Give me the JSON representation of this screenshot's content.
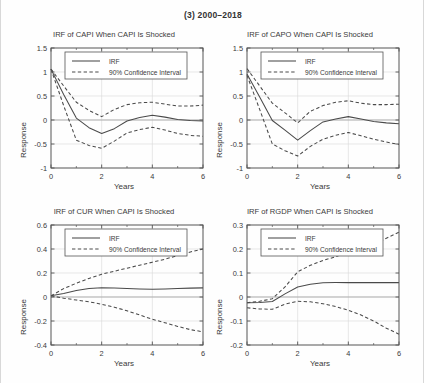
{
  "figure": {
    "title": "(3) 2000–2018",
    "background": "#ffffff",
    "line_color": "#4a4a4a",
    "axis_color": "#555555",
    "grid_color": "#d9d9d9"
  },
  "legend": {
    "irf_label": "IRF",
    "ci_label": "90% Confidence Interval"
  },
  "axis_titles": {
    "y": "Response",
    "x": "Years"
  },
  "chart_data": [
    {
      "type": "line",
      "id": "capi",
      "title": "IRF of CAPI When CAPI Is Shocked",
      "xlabel": "Years",
      "ylabel": "Response",
      "xlim": [
        0,
        6
      ],
      "ylim": [
        -1,
        1.5
      ],
      "xticks": [
        0,
        2,
        4,
        6
      ],
      "xticklabels": [
        "0",
        "2",
        "4",
        "6"
      ],
      "yticks": [
        -1,
        -0.5,
        0,
        0.5,
        1,
        1.5
      ],
      "yticklabels": [
        "-1",
        "-0.5",
        "0",
        "0.5",
        "1",
        "1.5"
      ],
      "grid": true,
      "legend_position": "top-center",
      "x": [
        0,
        0.5,
        1,
        1.5,
        2,
        2.5,
        3,
        3.5,
        4,
        4.5,
        5,
        5.5,
        6
      ],
      "series": [
        {
          "name": "IRF",
          "style": "solid",
          "values": [
            1.06,
            0.53,
            0.04,
            -0.16,
            -0.28,
            -0.18,
            -0.02,
            0.05,
            0.1,
            0.06,
            0.01,
            -0.01,
            -0.02
          ]
        },
        {
          "name": "90% Confidence Interval Upper",
          "style": "dashed",
          "values": [
            1.06,
            0.71,
            0.37,
            0.2,
            0.07,
            0.22,
            0.32,
            0.36,
            0.37,
            0.33,
            0.29,
            0.29,
            0.31
          ]
        },
        {
          "name": "90% Confidence Interval Lower",
          "style": "dashed",
          "values": [
            1.06,
            0.3,
            -0.42,
            -0.53,
            -0.59,
            -0.44,
            -0.27,
            -0.2,
            -0.15,
            -0.21,
            -0.28,
            -0.32,
            -0.34
          ]
        }
      ]
    },
    {
      "type": "line",
      "id": "capo",
      "title": "IRF of CAPO When CAPI Is Shocked",
      "xlabel": "Years",
      "ylabel": "Response",
      "xlim": [
        0,
        6
      ],
      "ylim": [
        -1,
        1.5
      ],
      "xticks": [
        0,
        2,
        4,
        6
      ],
      "xticklabels": [
        "0",
        "2",
        "4",
        "6"
      ],
      "yticks": [
        -1,
        -0.5,
        0,
        0.5,
        1,
        1.5
      ],
      "yticklabels": [
        "-1",
        "-0.5",
        "0",
        "0.5",
        "1",
        "1.5"
      ],
      "grid": true,
      "legend_position": "top-center",
      "x": [
        0,
        0.5,
        1,
        1.5,
        2,
        2.5,
        3,
        3.5,
        4,
        4.5,
        5,
        5.5,
        6
      ],
      "series": [
        {
          "name": "IRF",
          "style": "solid",
          "values": [
            0.96,
            0.48,
            -0.01,
            -0.21,
            -0.42,
            -0.22,
            -0.04,
            0.02,
            0.07,
            0.02,
            -0.03,
            -0.06,
            -0.08
          ]
        },
        {
          "name": "90% Confidence Interval Upper",
          "style": "dashed",
          "values": [
            1.07,
            0.71,
            0.35,
            0.15,
            -0.06,
            0.18,
            0.3,
            0.37,
            0.4,
            0.35,
            0.32,
            0.32,
            0.33
          ]
        },
        {
          "name": "90% Confidence Interval Lower",
          "style": "dashed",
          "values": [
            0.93,
            0.22,
            -0.5,
            -0.64,
            -0.75,
            -0.55,
            -0.4,
            -0.32,
            -0.26,
            -0.33,
            -0.4,
            -0.46,
            -0.51
          ]
        }
      ]
    },
    {
      "type": "line",
      "id": "cur",
      "title": "IRF of CUR When CAPI Is Shocked",
      "xlabel": "Years",
      "ylabel": "Response",
      "xlim": [
        0,
        6
      ],
      "ylim": [
        -0.4,
        0.6
      ],
      "xticks": [
        0,
        2,
        4,
        6
      ],
      "xticklabels": [
        "0",
        "2",
        "4",
        "6"
      ],
      "yticks": [
        -0.4,
        -0.2,
        0,
        0.2,
        0.4,
        0.6
      ],
      "yticklabels": [
        "-0.4",
        "-0.2",
        "0",
        "0.2",
        "0.4",
        "0.6"
      ],
      "grid": true,
      "legend_position": "top-center",
      "x": [
        0,
        0.5,
        1,
        1.5,
        2,
        2.5,
        3,
        3.5,
        4,
        4.5,
        5,
        5.5,
        6
      ],
      "series": [
        {
          "name": "IRF",
          "style": "solid",
          "values": [
            0.01,
            0.03,
            0.055,
            0.07,
            0.077,
            0.075,
            0.07,
            0.066,
            0.064,
            0.067,
            0.071,
            0.074,
            0.076
          ]
        },
        {
          "name": "90% Confidence Interval Upper",
          "style": "dashed",
          "values": [
            0.01,
            0.07,
            0.115,
            0.155,
            0.19,
            0.215,
            0.24,
            0.265,
            0.29,
            0.315,
            0.345,
            0.375,
            0.4
          ]
        },
        {
          "name": "90% Confidence Interval Lower",
          "style": "dashed",
          "values": [
            0.01,
            -0.01,
            -0.025,
            -0.04,
            -0.06,
            -0.085,
            -0.115,
            -0.15,
            -0.185,
            -0.215,
            -0.245,
            -0.272,
            -0.29
          ]
        }
      ]
    },
    {
      "type": "line",
      "id": "rgdp",
      "title": "IRF of RGDP When CAPI Is Shocked",
      "xlabel": "Years",
      "ylabel": "Response",
      "xlim": [
        0,
        6
      ],
      "ylim": [
        -0.2,
        0.3
      ],
      "xticks": [
        0,
        2,
        4,
        6
      ],
      "xticklabels": [
        "0",
        "2",
        "4",
        "6"
      ],
      "yticks": [
        -0.2,
        -0.1,
        0,
        0.1,
        0.2,
        0.3
      ],
      "yticklabels": [
        "-0.2",
        "-0.1",
        "0",
        "0.1",
        "0.2",
        "0.3"
      ],
      "grid": true,
      "legend_position": "top-center",
      "x": [
        0,
        0.5,
        1,
        1.5,
        2,
        2.5,
        3,
        3.5,
        4,
        4.5,
        5,
        5.5,
        6
      ],
      "series": [
        {
          "name": "IRF",
          "style": "solid",
          "values": [
            -0.024,
            -0.023,
            -0.019,
            0.013,
            0.042,
            0.053,
            0.059,
            0.06,
            0.06,
            0.06,
            0.06,
            0.06,
            0.06
          ]
        },
        {
          "name": "90% Confidence Interval Upper",
          "style": "dashed",
          "values": [
            -0.024,
            -0.018,
            -0.007,
            0.042,
            0.105,
            0.132,
            0.152,
            0.168,
            0.186,
            0.2,
            0.218,
            0.245,
            0.27
          ]
        },
        {
          "name": "90% Confidence Interval Lower",
          "style": "dashed",
          "values": [
            -0.045,
            -0.05,
            -0.051,
            -0.03,
            -0.018,
            -0.02,
            -0.028,
            -0.04,
            -0.055,
            -0.075,
            -0.1,
            -0.13,
            -0.155
          ]
        }
      ]
    }
  ]
}
